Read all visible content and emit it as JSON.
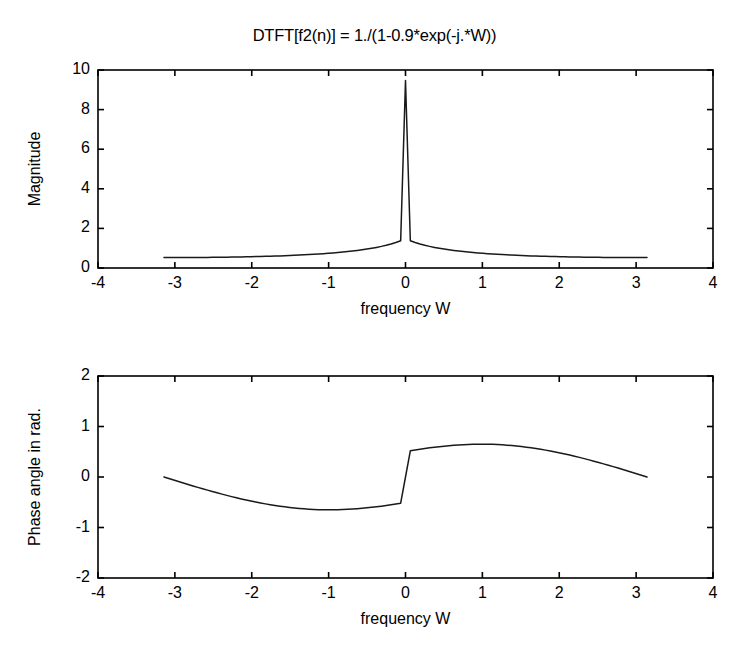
{
  "figure": {
    "background_color": "#ffffff",
    "line_color": "#1a1a1a",
    "axis_color": "#000000"
  },
  "chart_data": [
    {
      "type": "line",
      "id": "magnitude",
      "title": "DTFT[f2(n)] = 1./(1-0.9*exp(-j.*W))",
      "xlabel": "frequency W",
      "ylabel": "Magnitude",
      "xlim": [
        -4,
        4
      ],
      "ylim": [
        0,
        10
      ],
      "xticks": [
        -4,
        -3,
        -2,
        -1,
        0,
        1,
        2,
        3,
        4
      ],
      "xticklabels": [
        "-4",
        "-3",
        "-2",
        "-1",
        "0",
        "1",
        "2",
        "3",
        "4"
      ],
      "yticks": [
        0,
        2,
        4,
        6,
        8,
        10
      ],
      "yticklabels": [
        "0",
        "2",
        "4",
        "6",
        "8",
        "10"
      ],
      "grid": false,
      "legend": null,
      "series": [
        {
          "name": "|H(W)|",
          "x": [
            -3.1416,
            -3.0788,
            -3.0159,
            -2.9531,
            -2.8903,
            -2.8274,
            -2.7646,
            -2.7018,
            -2.6389,
            -2.5761,
            -2.5133,
            -2.4504,
            -2.3876,
            -2.3248,
            -2.2619,
            -2.1991,
            -2.1363,
            -2.0735,
            -2.0106,
            -1.9478,
            -1.885,
            -1.8221,
            -1.7593,
            -1.6965,
            -1.6336,
            -1.5708,
            -1.508,
            -1.4451,
            -1.3823,
            -1.3195,
            -1.2566,
            -1.1938,
            -1.131,
            -1.0681,
            -1.0053,
            -0.9425,
            -0.8796,
            -0.8168,
            -0.754,
            -0.6912,
            -0.6283,
            -0.5655,
            -0.5027,
            -0.4398,
            -0.377,
            -0.3142,
            -0.2513,
            -0.1885,
            -0.1257,
            -0.0628,
            0,
            0.0628,
            0.1257,
            0.1885,
            0.2513,
            0.3142,
            0.377,
            0.4398,
            0.5027,
            0.5655,
            0.6283,
            0.6912,
            0.754,
            0.8168,
            0.8796,
            0.9425,
            1.0053,
            1.0681,
            1.131,
            1.1938,
            1.2566,
            1.3195,
            1.3823,
            1.4451,
            1.508,
            1.5708,
            1.6336,
            1.6965,
            1.7593,
            1.8221,
            1.885,
            1.9478,
            2.0106,
            2.0735,
            2.1363,
            2.1991,
            2.2619,
            2.3248,
            2.3876,
            2.4504,
            2.5133,
            2.5761,
            2.6389,
            2.7018,
            2.7646,
            2.8274,
            2.8903,
            2.9531,
            3.0159,
            3.0788,
            3.1416
          ],
          "y": [
            0.5263,
            0.5264,
            0.5268,
            0.5274,
            0.5283,
            0.5294,
            0.5308,
            0.5324,
            0.5343,
            0.5365,
            0.539,
            0.5418,
            0.5448,
            0.5482,
            0.5519,
            0.556,
            0.5604,
            0.5652,
            0.5704,
            0.5761,
            0.5822,
            0.5887,
            0.5958,
            0.6035,
            0.6117,
            0.6206,
            0.6301,
            0.6404,
            0.6515,
            0.6635,
            0.6764,
            0.6903,
            0.7054,
            0.7217,
            0.7394,
            0.7586,
            0.7795,
            0.8023,
            0.8272,
            0.8545,
            0.8845,
            0.9176,
            0.9542,
            0.9949,
            1.0404,
            1.0914,
            1.1489,
            1.2141,
            1.2885,
            1.374,
            9.4728,
            1.374,
            1.2885,
            1.2141,
            1.1489,
            1.0914,
            1.0404,
            0.9949,
            0.9542,
            0.9176,
            0.8845,
            0.8545,
            0.8272,
            0.8023,
            0.7795,
            0.7586,
            0.7394,
            0.7217,
            0.7054,
            0.6903,
            0.6764,
            0.6635,
            0.6515,
            0.6404,
            0.6301,
            0.6206,
            0.6117,
            0.6035,
            0.5958,
            0.5887,
            0.5822,
            0.5761,
            0.5704,
            0.5652,
            0.5604,
            0.556,
            0.5519,
            0.5482,
            0.5448,
            0.5418,
            0.539,
            0.5365,
            0.5343,
            0.5324,
            0.5308,
            0.5294,
            0.5283,
            0.5274,
            0.5268,
            0.5264,
            0.5263
          ],
          "peak_value": 9.7,
          "peak_x": 0,
          "endpoint_value": 0.53
        }
      ]
    },
    {
      "type": "line",
      "id": "phase",
      "title": "",
      "xlabel": "frequency W",
      "ylabel": "Phase angle in rad.",
      "xlim": [
        -4,
        4
      ],
      "ylim": [
        -2,
        2
      ],
      "xticks": [
        -4,
        -3,
        -2,
        -1,
        0,
        1,
        2,
        3,
        4
      ],
      "xticklabels": [
        "-4",
        "-3",
        "-2",
        "-1",
        "0",
        "1",
        "2",
        "3",
        "4"
      ],
      "yticks": [
        -2,
        -1,
        0,
        1,
        2
      ],
      "yticklabels": [
        "-2",
        "-1",
        "0",
        "1",
        "2"
      ],
      "grid": false,
      "legend": null,
      "series": [
        {
          "name": "arg H(W)",
          "x": [
            -3.1416,
            -3.0788,
            -3.0159,
            -2.9531,
            -2.8903,
            -2.8274,
            -2.7646,
            -2.7018,
            -2.6389,
            -2.5761,
            -2.5133,
            -2.4504,
            -2.3876,
            -2.3248,
            -2.2619,
            -2.1991,
            -2.1363,
            -2.0735,
            -2.0106,
            -1.9478,
            -1.885,
            -1.8221,
            -1.7593,
            -1.6965,
            -1.6336,
            -1.5708,
            -1.508,
            -1.4451,
            -1.3823,
            -1.3195,
            -1.2566,
            -1.1938,
            -1.131,
            -1.0681,
            -1.0053,
            -0.9425,
            -0.8796,
            -0.8168,
            -0.754,
            -0.6912,
            -0.6283,
            -0.5655,
            -0.5027,
            -0.4398,
            -0.377,
            -0.3142,
            -0.2513,
            -0.1885,
            -0.1257,
            -0.0628,
            0,
            0.0628,
            0.1257,
            0.1885,
            0.2513,
            0.3142,
            0.377,
            0.4398,
            0.5027,
            0.5655,
            0.6283,
            0.6912,
            0.754,
            0.8168,
            0.8796,
            0.9425,
            1.0053,
            1.0681,
            1.131,
            1.1938,
            1.2566,
            1.3195,
            1.3823,
            1.4451,
            1.508,
            1.5708,
            1.6336,
            1.6965,
            1.7593,
            1.8221,
            1.885,
            1.9478,
            2.0106,
            2.0735,
            2.1363,
            2.1991,
            2.2619,
            2.3248,
            2.3876,
            2.4504,
            2.5133,
            2.5761,
            2.6389,
            2.7018,
            2.7646,
            2.8274,
            2.8903,
            2.9531,
            3.0159,
            3.0788,
            3.1416
          ],
          "y": [
            -0.0,
            -0.0299,
            -0.0597,
            -0.0893,
            -0.1187,
            -0.1478,
            -0.1766,
            -0.205,
            -0.233,
            -0.2604,
            -0.2873,
            -0.3136,
            -0.3392,
            -0.3641,
            -0.3883,
            -0.4116,
            -0.4341,
            -0.4557,
            -0.4764,
            -0.4961,
            -0.5147,
            -0.5323,
            -0.5488,
            -0.5641,
            -0.5783,
            -0.5913,
            -0.603,
            -0.6135,
            -0.6227,
            -0.6306,
            -0.6372,
            -0.6424,
            -0.6463,
            -0.6488,
            -0.6499,
            -0.6497,
            -0.6481,
            -0.6452,
            -0.6409,
            -0.6354,
            -0.6285,
            -0.6205,
            -0.6112,
            -0.6009,
            -0.5895,
            -0.5771,
            -0.5638,
            -0.5496,
            -0.5347,
            -0.5191,
            -0.0,
            0.5191,
            0.5347,
            0.5496,
            0.5638,
            0.5771,
            0.5895,
            0.6009,
            0.6112,
            0.6205,
            0.6285,
            0.6354,
            0.6409,
            0.6452,
            0.6481,
            0.6497,
            0.6499,
            0.6488,
            0.6463,
            0.6424,
            0.6372,
            0.6306,
            0.6227,
            0.6135,
            0.603,
            0.5913,
            0.5783,
            0.5641,
            0.5488,
            0.5323,
            0.5147,
            0.4961,
            0.4764,
            0.4557,
            0.4341,
            0.4116,
            0.3883,
            0.3641,
            0.3392,
            0.3136,
            0.2873,
            0.2604,
            0.233,
            0.205,
            0.1766,
            0.1478,
            0.1187,
            0.0893,
            0.0597,
            0.0299,
            0.0
          ],
          "max_value": 1.12,
          "max_x": -0.45,
          "min_value": -1.12,
          "min_x": 0.45,
          "endpoint_value": -0.04
        }
      ]
    }
  ]
}
